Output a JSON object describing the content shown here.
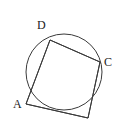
{
  "figure": {
    "name": "cyclic-quadrilateral",
    "background_color": "#ffffff",
    "stroke_color": "#3a3a3a",
    "label_color": "#1a1a1a",
    "stroke_width": 1,
    "circle": {
      "cx": 64,
      "cy": 72,
      "r": 38
    },
    "vertices": [
      {
        "id": "D",
        "label": "D",
        "x": 50,
        "y": 40,
        "label_x": 37,
        "label_y": 19
      },
      {
        "id": "C",
        "label": "C",
        "x": 100,
        "y": 62,
        "label_x": 104,
        "label_y": 56
      },
      {
        "id": "B",
        "label": "",
        "x": 88,
        "y": 118,
        "label_x": 0,
        "label_y": 0
      },
      {
        "id": "A",
        "label": "A",
        "x": 26,
        "y": 104,
        "label_x": 13,
        "label_y": 98
      }
    ],
    "edges": [
      {
        "id": "edge-DC",
        "from": "D",
        "to": "C"
      },
      {
        "id": "edge-CB",
        "from": "C",
        "to": "B"
      },
      {
        "id": "edge-BA",
        "from": "B",
        "to": "A"
      },
      {
        "id": "edge-AD",
        "from": "A",
        "to": "D"
      }
    ],
    "polygon_points": "50,40 100,62 88,118 26,104"
  }
}
